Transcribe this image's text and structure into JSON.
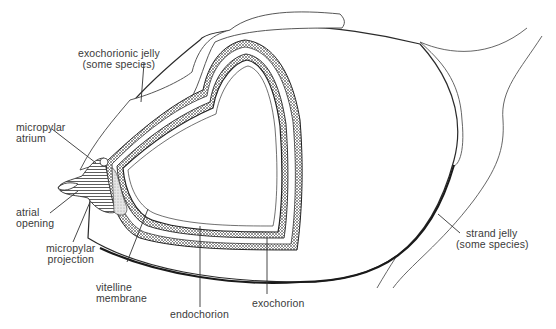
{
  "diagram": {
    "labels": {
      "exochorionic_jelly": {
        "line1": "exochorionic jelly",
        "line2": "(some species)"
      },
      "micropylar_atrium": {
        "line1": "micropylar",
        "line2": "atrium"
      },
      "atrial_opening": {
        "line1": "atrial",
        "line2": "opening"
      },
      "micropylar_projection": {
        "line1": "micropylar",
        "line2": "projection"
      },
      "vitelline_membrane": {
        "line1": "vitelline",
        "line2": "membrane"
      },
      "endochorion": {
        "line1": "endochorion"
      },
      "exochorion": {
        "line1": "exochorion"
      },
      "strand_jelly": {
        "line1": "strand jelly",
        "line2": "(some species)"
      }
    },
    "colors": {
      "line": "#2a2a2a",
      "thin_line": "#555555",
      "text": "#3a3a3a",
      "background": "#ffffff"
    }
  }
}
